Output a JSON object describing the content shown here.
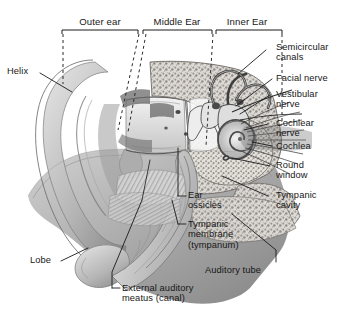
{
  "figure": {
    "background": "#ffffff",
    "text_color": "#171717",
    "line_color": "#1a1a1a"
  },
  "regions": [
    {
      "id": "outer-ear",
      "label": "Outer ear",
      "x": 62,
      "y": 16,
      "w": 76
    },
    {
      "id": "middle-ear",
      "label": "Middle Ear",
      "x": 142,
      "y": 16,
      "w": 70
    },
    {
      "id": "inner-ear",
      "label": "Inner Ear",
      "x": 214,
      "y": 16,
      "w": 66
    }
  ],
  "labels": {
    "helix": "Helix",
    "lobe": "Lobe",
    "semicircular_canals": "Semicircular\ncanals",
    "facial_nerve": "Facial nerve",
    "vestibular_nerve": "Vestibular\nnerve",
    "cochlear_nerve": "Cochlear\nnerve",
    "cochlea": "Cochlea",
    "round_window": "Round\nwindow",
    "tympanic_cavity": "Tympanic\ncavity",
    "ear_ossicles": "Ear\nossicles",
    "tympanic_membrane": "Tympanic\nmembrane\n(tympanum)",
    "auditory_tube": "Auditory tube",
    "external_auditory_meatus": "External auditory\nmeatus (canal)"
  }
}
